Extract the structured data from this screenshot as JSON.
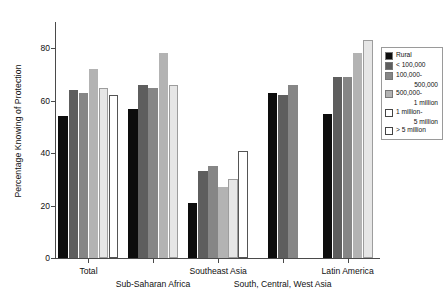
{
  "chart_data": {
    "type": "bar",
    "title": "",
    "xlabel": "",
    "ylabel": "Percentage Knowing of Protection",
    "ylim": [
      0,
      90
    ],
    "yticks": [
      0,
      20,
      40,
      60,
      80
    ],
    "ytick_labels": [
      "0",
      "20",
      "40",
      "60",
      "80"
    ],
    "grid": false,
    "legend_position": "right",
    "categories": [
      "Total",
      "Sub-Saharan Africa",
      "Southeast Asia",
      "South, Central, West Asia",
      "Latin America"
    ],
    "series": [
      {
        "name": "Rural",
        "color": "#0d0d0d",
        "values": [
          54,
          57,
          21,
          63,
          55
        ]
      },
      {
        "name": "< 100,000",
        "color": "#5e5e5e",
        "values": [
          64,
          66,
          33,
          62,
          69
        ]
      },
      {
        "name": "100,000-\n500,000",
        "color": "#868686",
        "values": [
          63,
          65,
          35,
          66,
          69
        ]
      },
      {
        "name": "500,000-\n1 million",
        "color": "#b3b3b3",
        "values": [
          72,
          78,
          27,
          null,
          78
        ]
      },
      {
        "name": "1 million-\n5 million",
        "color": "#e6e6e6",
        "values": [
          65,
          66,
          30,
          null,
          83
        ]
      },
      {
        "name": "> 5 million",
        "color": "#ffffff",
        "values": [
          62,
          null,
          41,
          null,
          null
        ]
      }
    ],
    "legend_entries": [
      {
        "label": "Rural",
        "color": "#0d0d0d",
        "indent": ""
      },
      {
        "label": "< 100,000",
        "color": "#5e5e5e",
        "indent": ""
      },
      {
        "label": "100,000-",
        "color": "#868686",
        "indent": "500,000"
      },
      {
        "label": "500,000-",
        "color": "#b3b3b3",
        "indent": "1 million"
      },
      {
        "label": "1 million-",
        "color": "#ffffff",
        "indent": "5 million"
      },
      {
        "label": "> 5 million",
        "color": "#ffffff",
        "indent": ""
      }
    ]
  },
  "axis": {
    "y_title": "Percentage Knowing of Protection"
  }
}
